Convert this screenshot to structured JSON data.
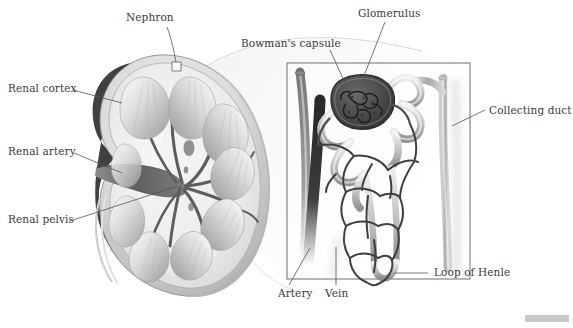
{
  "figure": {
    "background_color": "#ffffff",
    "label_color": "#3b3b40",
    "leader_line_color": "#55555a"
  },
  "labels": {
    "nephron": "Nephron",
    "renal_cortex": "Renal cortex",
    "renal_artery": "Renal artery",
    "renal_pelvis": "Renal pelvis",
    "bowmans_capsule": "Bowman's capsule",
    "glomerulus": "Glomerulus",
    "collecting_duct": "Collecting duct",
    "artery": "Artery",
    "vein": "Vein",
    "loop_of_henle": "Loop of Henle"
  },
  "callouts": [
    {
      "name": "nephron",
      "text": "Nephron",
      "x": 126,
      "y": 17,
      "anchor_x": 175,
      "anchor_y": 65
    },
    {
      "name": "renal-cortex",
      "text": "Renal cortex",
      "x": 8,
      "y": 88,
      "anchor_x": 118,
      "anchor_y": 104
    },
    {
      "name": "renal-artery",
      "text": "Renal artery",
      "x": 8,
      "y": 150,
      "anchor_x": 110,
      "anchor_y": 175
    },
    {
      "name": "renal-pelvis",
      "text": "Renal pelvis",
      "x": 8,
      "y": 219,
      "anchor_x": 170,
      "anchor_y": 186
    },
    {
      "name": "bowmans-capsule",
      "text": "Bowman's capsule",
      "x": 241,
      "y": 39,
      "anchor_x": 340,
      "anchor_y": 85
    },
    {
      "name": "glomerulus",
      "text": "Glomerulus",
      "x": 360,
      "y": 10,
      "anchor_x": 355,
      "anchor_y": 88
    },
    {
      "name": "collecting-duct",
      "text": "Collecting duct",
      "x": 487,
      "y": 106,
      "anchor_x": 452,
      "anchor_y": 128
    },
    {
      "name": "artery",
      "text": "Artery",
      "x": 278,
      "y": 292,
      "anchor_x": 305,
      "anchor_y": 252
    },
    {
      "name": "vein",
      "text": "Vein",
      "x": 327,
      "y": 292,
      "anchor_x": 332,
      "anchor_y": 252
    },
    {
      "name": "loop-of-henle",
      "text": "Loop of Henle",
      "x": 432,
      "y": 270,
      "anchor_x": 398,
      "anchor_y": 272
    }
  ],
  "kidney_section": {
    "name": "kidney-cross-section",
    "description": "Coronal section of kidney showing cortex, medullary pyramids, renal artery, renal pelvis",
    "pyramid_count": 9,
    "nephron_marker_box": {
      "x": 172,
      "y": 62,
      "w": 9,
      "h": 9
    }
  },
  "nephron_inset": {
    "name": "nephron-detail-box",
    "box": {
      "x": 287,
      "y": 63,
      "w": 183,
      "h": 216
    },
    "structures": [
      "glomerulus",
      "bowmans-capsule",
      "proximal-convoluted-tubule",
      "distal-convoluted-tubule",
      "peritubular-capillaries",
      "loop-of-henle",
      "collecting-duct",
      "artery",
      "vein"
    ]
  },
  "corner_bar": {
    "name": "corner-scale-bar",
    "color": "#c9c9c9"
  }
}
